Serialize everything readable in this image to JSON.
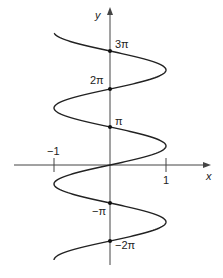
{
  "chart_data": {
    "type": "line",
    "title": "",
    "xlabel": "x",
    "ylabel": "y",
    "function": "x = sin(y)",
    "xlim": [
      -1,
      1
    ],
    "ylim_radians": [
      -2.5,
      3.47
    ],
    "x_ticks": [
      {
        "value": -1,
        "label": "−1"
      },
      {
        "value": 1,
        "label": "1"
      }
    ],
    "y_marked_points": [
      {
        "value_pi": 3,
        "label": "3π",
        "x": 0
      },
      {
        "value_pi": 2,
        "label": "2π",
        "x": 0
      },
      {
        "value_pi": 1,
        "label": "π",
        "x": 0
      },
      {
        "value_pi": -1,
        "label": "−π",
        "x": 0
      },
      {
        "value_pi": -2,
        "label": "−2π",
        "x": 0
      }
    ],
    "series": [
      {
        "name": "x = sin y",
        "y_start_pi": -2.5,
        "y_end_pi": 3.47,
        "color": "#222222"
      }
    ],
    "grid": false,
    "legend": null
  },
  "labels": {
    "x_axis": "x",
    "y_axis": "y",
    "x_tick_neg1": "−1",
    "x_tick_pos1": "1",
    "y_3pi": "3π",
    "y_2pi": "2π",
    "y_pi": "π",
    "y_negpi": "−π",
    "y_neg2pi": "−2π"
  },
  "colors": {
    "curve": "#222222",
    "axes": "#444444"
  }
}
